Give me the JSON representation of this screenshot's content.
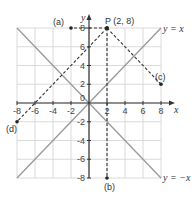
{
  "diagram": {
    "axes": {
      "x_label": "x",
      "y_label": "y",
      "x_range": [
        -8,
        8
      ],
      "y_range": [
        -8,
        8
      ],
      "grid_step": 2,
      "origin_label": "0",
      "x_ticks": [
        {
          "value": -8,
          "label": "-8"
        },
        {
          "value": -6,
          "label": "-6"
        },
        {
          "value": -4,
          "label": "-4"
        },
        {
          "value": -2,
          "label": "-2"
        },
        {
          "value": 2,
          "label": "2"
        },
        {
          "value": 4,
          "label": "4"
        },
        {
          "value": 6,
          "label": "6"
        },
        {
          "value": 8,
          "label": "8"
        }
      ],
      "y_ticks": [
        {
          "value": 8,
          "label": "8"
        },
        {
          "value": 6,
          "label": "6"
        },
        {
          "value": 4,
          "label": "4"
        },
        {
          "value": 2,
          "label": "2"
        },
        {
          "value": -2,
          "label": "-2"
        },
        {
          "value": -4,
          "label": "-4"
        },
        {
          "value": -6,
          "label": "-6"
        },
        {
          "value": -8,
          "label": "-8"
        }
      ]
    },
    "lines": [
      {
        "name": "y-equals-x",
        "label": "y = x",
        "from": [
          -8,
          -8
        ],
        "to": [
          8,
          8
        ]
      },
      {
        "name": "y-equals-negative-x",
        "label": "y = −x",
        "from": [
          -8,
          8
        ],
        "to": [
          8,
          -8
        ]
      }
    ],
    "point_P": {
      "label": "P (2, 8)",
      "x": 2,
      "y": 8
    },
    "images": [
      {
        "label": "(a)",
        "x": -2,
        "y": 8
      },
      {
        "label": "(b)",
        "x": 2,
        "y": -8
      },
      {
        "label": "(c)",
        "x": 8,
        "y": 2
      },
      {
        "label": "(d)",
        "x": -8,
        "y": -2
      }
    ],
    "colors": {
      "grid": "#d0d0d0",
      "mirror_line": "#999999",
      "axis": "#333333",
      "dashed": "#333333"
    }
  }
}
